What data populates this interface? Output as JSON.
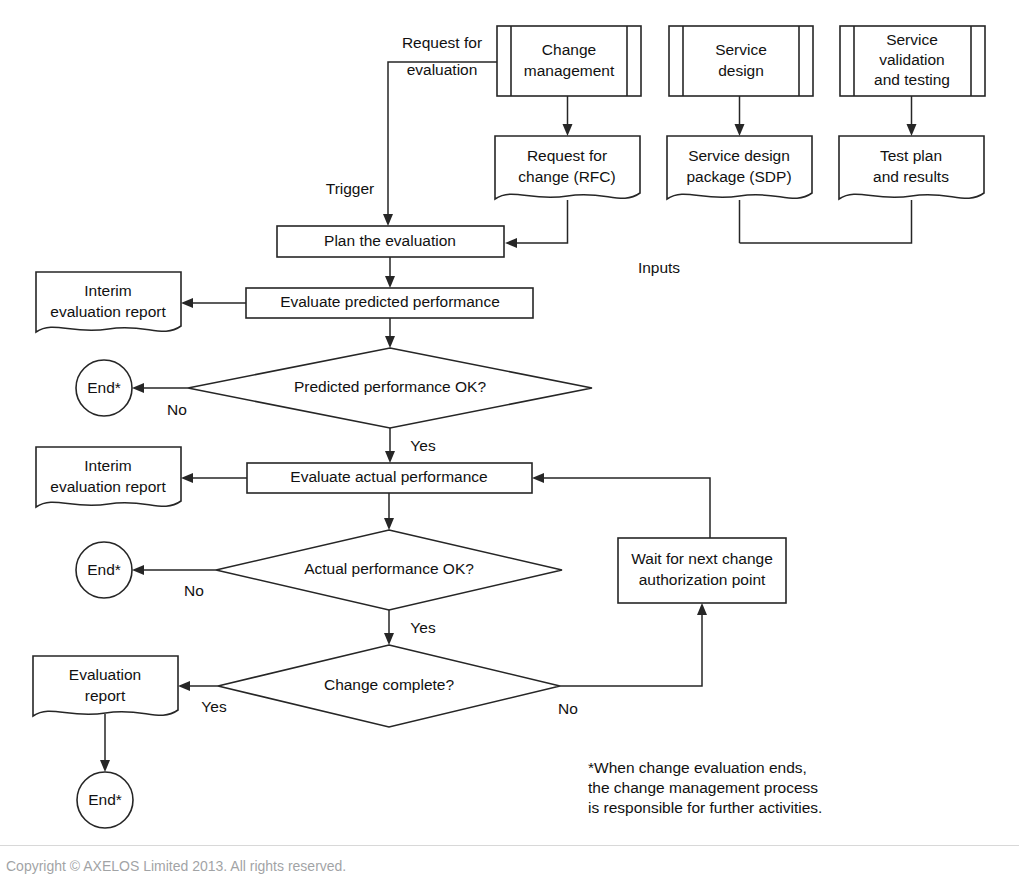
{
  "diagram": {
    "stroke_color": "#262626",
    "text_color": "#111111",
    "background": "#ffffff",
    "nodes": {
      "change_management": {
        "label_line1": "Change",
        "label_line2": "management",
        "shape": "predefined-process"
      },
      "service_design": {
        "label_line1": "Service",
        "label_line2": "design",
        "shape": "predefined-process"
      },
      "service_validation": {
        "label_line1": "Service",
        "label_line2": "validation",
        "label_line3": "and testing",
        "shape": "predefined-process"
      },
      "rfc_document": {
        "label_line1": "Request for",
        "label_line2": "change (RFC)",
        "shape": "document"
      },
      "sdp_document": {
        "label_line1": "Service design",
        "label_line2": "package (SDP)",
        "shape": "document"
      },
      "test_plan_document": {
        "label_line1": "Test plan",
        "label_line2": "and results",
        "shape": "document"
      },
      "plan_evaluation": {
        "label": "Plan the evaluation",
        "shape": "process"
      },
      "evaluate_predicted": {
        "label": "Evaluate predicted performance",
        "shape": "process"
      },
      "evaluate_actual": {
        "label": "Evaluate actual performance",
        "shape": "process"
      },
      "wait_authorization": {
        "label_line1": "Wait for next change",
        "label_line2": "authorization point",
        "shape": "process"
      },
      "predicted_decision": {
        "label": "Predicted performance OK?",
        "shape": "decision"
      },
      "actual_decision": {
        "label": "Actual performance OK?",
        "shape": "decision"
      },
      "change_complete_decision": {
        "label": "Change complete?",
        "shape": "decision"
      },
      "interim_report_1": {
        "label_line1": "Interim",
        "label_line2": "evaluation report",
        "shape": "document"
      },
      "interim_report_2": {
        "label_line1": "Interim",
        "label_line2": "evaluation report",
        "shape": "document"
      },
      "evaluation_report": {
        "label_line1": "Evaluation",
        "label_line2": "report",
        "shape": "document"
      },
      "end_1": {
        "label": "End*",
        "shape": "terminator"
      },
      "end_2": {
        "label": "End*",
        "shape": "terminator"
      },
      "end_3": {
        "label": "End*",
        "shape": "terminator"
      }
    },
    "edge_labels": {
      "request_for_evaluation_line1": "Request for",
      "request_for_evaluation_line2": "evaluation",
      "trigger": "Trigger",
      "inputs": "Inputs",
      "predicted_no": "No",
      "predicted_yes": "Yes",
      "actual_no": "No",
      "actual_yes": "Yes",
      "complete_yes": "Yes",
      "complete_no": "No"
    },
    "footnote": "*When change evaluation ends,\nthe change management process\nis responsible for further activities.",
    "copyright": "Copyright © AXELOS Limited 2013. All rights reserved."
  }
}
